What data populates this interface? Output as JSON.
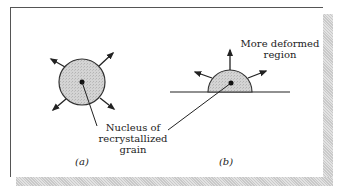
{
  "figure": {
    "panels": [
      {
        "id": "a",
        "caption": "(a)",
        "shape": "circle"
      },
      {
        "id": "b",
        "caption": "(b)",
        "shape": "semicircle-on-boundary"
      }
    ],
    "labels": {
      "nucleus_line1": "Nucleus of",
      "nucleus_line2": "recrystallized",
      "nucleus_line3": "grain",
      "deformed_line1": "More deformed",
      "deformed_line2": "region"
    },
    "colors": {
      "grain_fill": "#cfcfcf",
      "line": "#222222",
      "shadow": "#d6d6d6"
    }
  }
}
